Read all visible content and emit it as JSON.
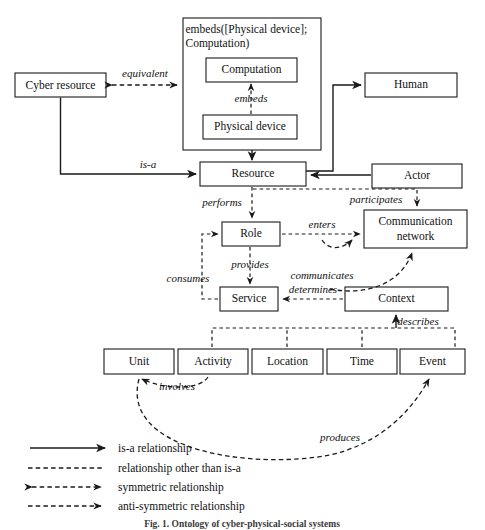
{
  "figure": {
    "caption": "Fig. 1.  Ontology of cyber-physical-social systems",
    "colors": {
      "stroke": "#1a1a1a",
      "text": "#111111",
      "background": "#ffffff"
    }
  },
  "nodes": {
    "cyber_resource": "Cyber resource",
    "computation": "Computation",
    "physical_device": "Physical device",
    "human": "Human",
    "resource": "Resource",
    "actor": "Actor",
    "role": "Role",
    "communication_network": "Communication network",
    "communication_network_line1": "Communication",
    "communication_network_line2": "network",
    "service": "Service",
    "context": "Context",
    "unit": "Unit",
    "activity": "Activity",
    "location": "Location",
    "time": "Time",
    "event": "Event"
  },
  "group": {
    "title_line1": "embeds([Physical device];",
    "title_line2": "Computation)"
  },
  "edges": {
    "equivalent": "equivalent",
    "embeds": "embeds",
    "is_a": "is-a",
    "performs": "performs",
    "participates": "participates",
    "enters": "enters",
    "provides": "provides",
    "communicates": "communicates",
    "consumes": "consumes",
    "determines": "determines",
    "describes": "describes",
    "involves": "involves",
    "produces": "produces"
  },
  "legend": {
    "items": [
      {
        "label": "is-a relationship",
        "style": "solid-arrow"
      },
      {
        "label": "relationship other than is-a",
        "style": "dashed-plain"
      },
      {
        "label": "symmetric relationship",
        "style": "dashed-double-arrow"
      },
      {
        "label": "anti-symmetric relationship",
        "style": "dashed-arrow"
      }
    ]
  }
}
